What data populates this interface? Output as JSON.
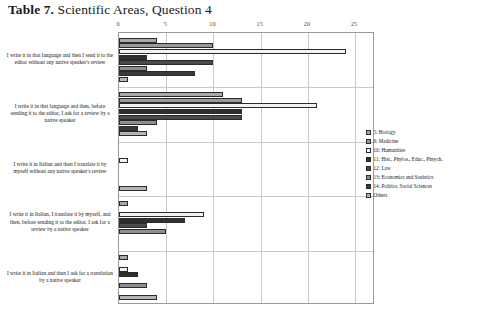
{
  "title": {
    "number": "Table 7.",
    "text": "Scientific Areas, Question 4"
  },
  "chart_data": {
    "type": "bar",
    "orientation": "horizontal",
    "title": "Table 7.  Scientific Areas, Question 4",
    "xlabel": "",
    "ylabel": "",
    "xlim": [
      0,
      27
    ],
    "grid": true,
    "legend_position": "right",
    "xticks": [
      "0",
      "5",
      "10",
      "15",
      "20",
      "25"
    ],
    "xtickvalues": [
      0,
      5,
      10,
      15,
      20,
      25
    ],
    "categories": [
      "I write it in that language and then I send it to the editor without any native speaker's review",
      "I write it in that language and then, before sending it to the editor, I ask for a review by a native speaker",
      "I write it in Italian and then I translate it by myself without any native speaker's review",
      "I write it in Italian, I translate it by myself, and then, before sending it to the editor, I ask for a review by a native speaker",
      "I write it in Italian and then I ask for a translation by a native speaker"
    ],
    "series": [
      {
        "name": "5: Biology",
        "values": [
          4,
          11,
          0,
          1,
          1
        ]
      },
      {
        "name": "6: Medicine",
        "values": [
          10,
          13,
          0,
          0,
          0
        ]
      },
      {
        "name": "10: Humanities",
        "values": [
          24,
          21,
          1,
          9,
          1
        ]
      },
      {
        "name": "11: Hist., Phylos., Educ., Phsych.",
        "values": [
          3,
          13,
          0,
          7,
          2
        ]
      },
      {
        "name": "12: Law",
        "values": [
          10,
          13,
          0,
          3,
          0
        ]
      },
      {
        "name": "13: Economics and Statistics",
        "values": [
          3,
          4,
          0,
          5,
          3
        ]
      },
      {
        "name": "14: Politics, Social Sciences",
        "values": [
          8,
          2,
          0,
          0,
          0
        ]
      },
      {
        "name": "Others",
        "values": [
          1,
          3,
          3,
          0,
          4
        ]
      }
    ]
  },
  "legend": {
    "items": [
      {
        "label": "5: Biology",
        "swatch": "swatch-series-0"
      },
      {
        "label": "6: Medicine",
        "swatch": "swatch-series-1"
      },
      {
        "label": "10: Humanities",
        "swatch": "swatch-series-2"
      },
      {
        "label": "11: Hist., Phylos., Educ., Phsych.",
        "swatch": "swatch-series-3"
      },
      {
        "label": "12: Law",
        "swatch": "swatch-series-4"
      },
      {
        "label": "13: Economics and Statistics",
        "swatch": "swatch-series-5"
      },
      {
        "label": "14: Politics, Social Sciences",
        "swatch": "swatch-series-6"
      },
      {
        "label": "Others",
        "swatch": "swatch-series-7"
      }
    ]
  }
}
